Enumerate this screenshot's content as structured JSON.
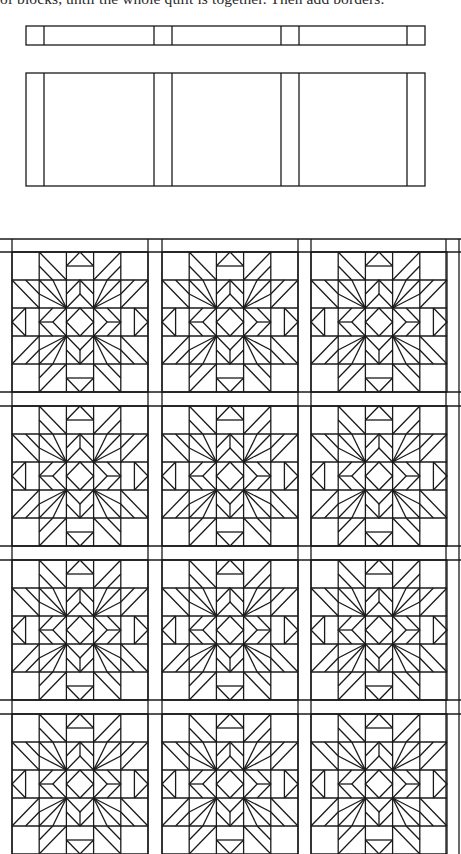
{
  "document": {
    "caption_text": "of blocks, until the whole quilt is together. Then add borders."
  },
  "diagrams": {
    "sashing_strip": {
      "label": "sashing-strip-diagram",
      "x": 26,
      "y": 26,
      "width": 399,
      "height": 19,
      "dividers_x": [
        44,
        154,
        172,
        281,
        299,
        407
      ]
    },
    "block_row": {
      "label": "block-row-with-sashing-diagram",
      "x": 26,
      "y": 73,
      "width": 399,
      "height": 113,
      "dividers_x": [
        44,
        154,
        172,
        281,
        299,
        407
      ]
    },
    "quilt": {
      "label": "assembled-quilt-diagram",
      "columns": 3,
      "rows": 4,
      "column_x": [
        12,
        162,
        311
      ],
      "row_y": [
        252,
        406,
        560,
        714
      ],
      "block_width": 136,
      "block_height": 140,
      "sashing_width": 14,
      "top_sash_y": 239,
      "vertical_lines_x": [
        12,
        148,
        162,
        298,
        311,
        446,
        459
      ],
      "horizontal_lines_y": [
        239,
        252,
        392,
        406,
        546,
        560,
        700,
        714
      ],
      "block_pattern": "star-block-5x5"
    }
  },
  "colors": {
    "line": "#1a1a1a",
    "background": "#ffffff",
    "text": "#2a2a2a"
  }
}
